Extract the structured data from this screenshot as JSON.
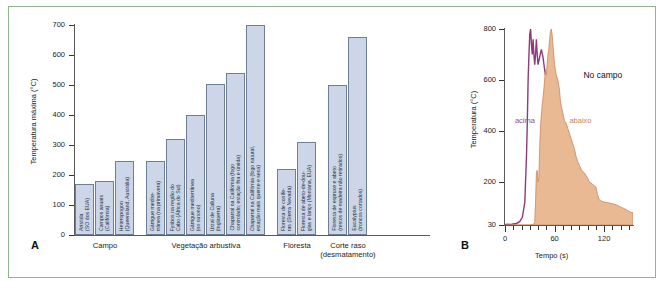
{
  "figure": {
    "panelA_letter": "A",
    "panelB_letter": "B"
  },
  "chart_data": [
    {
      "type": "bar",
      "panel": "A",
      "title": "",
      "xlabel": "",
      "ylabel": "Temperatura máxima (°C)",
      "ylim": [
        0,
        700
      ],
      "yticks": [
        0,
        100,
        200,
        300,
        400,
        500,
        600,
        700
      ],
      "grid": false,
      "bar_color": "#ccd6e8",
      "bar_border_color": "#6d7e96",
      "groups": [
        {
          "label": "Campo",
          "bars": [
            {
              "label": "Aristida\n(SO dos EUA)",
              "value": 170
            },
            {
              "label": "Campos anuais\n(Califórnia)",
              "value": 180
            },
            {
              "label": "Heteropogon\n(Queensland, Austrália)",
              "value": 248
            }
          ]
        },
        {
          "label": "Vegetação arbustiva",
          "bars": [
            {
              "label": "Gárrigue medite-\nrrânea (na primavera)",
              "value": 248
            },
            {
              "label": "Fynbos na região do\nCabo (África do Sul)",
              "value": 320
            },
            {
              "label": "Gárrigue mediterrânea\n(no outono)",
              "value": 400
            },
            {
              "label": "Urzal de Calluna\n(Inglaterra)",
              "value": 502
            },
            {
              "label": "Chaparral na Califórnia (fogo\ncontrolado; estação fria e úmida)",
              "value": 540
            },
            {
              "label": "Chaparral na Califórnia (fogo natural,\nestação mais quente e seca)",
              "value": 700
            }
          ]
        },
        {
          "label": "Floresta",
          "bars": [
            {
              "label": "Floresta de conífe-\nras (Sierra Nevada)",
              "value": 220
            },
            {
              "label": "Floresta de abeto-de-dou-\nglas e lariço (Montana, EUA)",
              "value": 310
            }
          ]
        },
        {
          "label": "Corte raso\n(desmatamento)",
          "bars": [
            {
              "label": "Floresta de espruce e abeto\n(restos de madeira não retirados)",
              "value": 500
            },
            {
              "label": "Eucalyptus\n(troncos cortados)",
              "value": 660
            }
          ]
        }
      ]
    },
    {
      "type": "area",
      "panel": "B",
      "title": "No campo",
      "xlabel": "Tempo (s)",
      "ylabel": "Temperatura (°C)",
      "xlim": [
        0,
        155
      ],
      "ylim": [
        30,
        800
      ],
      "xticks": [
        0,
        60,
        120
      ],
      "yticks": [
        30,
        200,
        400,
        600,
        800
      ],
      "grid": false,
      "series": [
        {
          "name": "acima",
          "color": "#8e3a78",
          "style": "line",
          "points": [
            [
              0,
              32
            ],
            [
              8,
              33
            ],
            [
              14,
              36
            ],
            [
              18,
              44
            ],
            [
              21,
              60
            ],
            [
              24,
              120
            ],
            [
              26,
              300
            ],
            [
              27,
              430
            ],
            [
              28,
              600
            ],
            [
              29,
              700
            ],
            [
              30,
              780
            ],
            [
              31,
              800
            ],
            [
              32,
              740
            ],
            [
              33,
              700
            ],
            [
              34,
              760
            ],
            [
              35,
              700
            ],
            [
              36,
              660
            ],
            [
              37,
              700
            ],
            [
              38,
              760
            ],
            [
              39,
              700
            ],
            [
              40,
              660
            ],
            [
              42,
              690
            ],
            [
              44,
              720
            ],
            [
              46,
              690
            ],
            [
              48,
              640
            ],
            [
              50,
              600
            ],
            [
              52,
              560
            ],
            [
              54,
              520
            ],
            [
              56,
              470
            ],
            [
              58,
              500
            ],
            [
              60,
              450
            ],
            [
              62,
              400
            ],
            [
              64,
              350
            ],
            [
              66,
              300
            ],
            [
              68,
              260
            ],
            [
              70,
              230
            ],
            [
              72,
              200
            ],
            [
              74,
              185
            ],
            [
              76,
              170
            ],
            [
              78,
              165
            ],
            [
              80,
              175
            ],
            [
              82,
              160
            ],
            [
              84,
              150
            ],
            [
              86,
              140
            ],
            [
              88,
              130
            ],
            [
              90,
              125
            ],
            [
              94,
              118
            ],
            [
              98,
              110
            ],
            [
              102,
              105
            ],
            [
              106,
              95
            ],
            [
              110,
              82
            ],
            [
              114,
              70
            ],
            [
              118,
              62
            ],
            [
              122,
              58
            ],
            [
              126,
              56
            ],
            [
              130,
              50
            ],
            [
              134,
              44
            ],
            [
              138,
              48
            ],
            [
              142,
              46
            ],
            [
              146,
              44
            ],
            [
              150,
              42
            ],
            [
              154,
              42
            ]
          ]
        },
        {
          "name": "abaixo",
          "color": "#c8855f",
          "fill": "#e9b994",
          "style": "area",
          "points": [
            [
              0,
              30
            ],
            [
              30,
              30
            ],
            [
              34,
              32
            ],
            [
              36,
              40
            ],
            [
              37,
              120
            ],
            [
              38,
              235
            ],
            [
              39,
              245
            ],
            [
              40,
              200
            ],
            [
              41,
              215
            ],
            [
              42,
              330
            ],
            [
              43,
              420
            ],
            [
              44,
              460
            ],
            [
              45,
              500
            ],
            [
              46,
              530
            ],
            [
              47,
              560
            ],
            [
              48,
              600
            ],
            [
              49,
              640
            ],
            [
              50,
              620
            ],
            [
              51,
              660
            ],
            [
              52,
              700
            ],
            [
              53,
              720
            ],
            [
              54,
              760
            ],
            [
              55,
              790
            ],
            [
              56,
              800
            ],
            [
              57,
              780
            ],
            [
              58,
              740
            ],
            [
              59,
              700
            ],
            [
              60,
              660
            ],
            [
              61,
              640
            ],
            [
              62,
              620
            ],
            [
              63,
              610
            ],
            [
              64,
              600
            ],
            [
              65,
              580
            ],
            [
              66,
              560
            ],
            [
              67,
              520
            ],
            [
              68,
              500
            ],
            [
              70,
              470
            ],
            [
              72,
              440
            ],
            [
              74,
              430
            ],
            [
              76,
              410
            ],
            [
              78,
              390
            ],
            [
              80,
              370
            ],
            [
              82,
              350
            ],
            [
              84,
              330
            ],
            [
              86,
              300
            ],
            [
              88,
              280
            ],
            [
              90,
              265
            ],
            [
              92,
              250
            ],
            [
              94,
              240
            ],
            [
              96,
              235
            ],
            [
              98,
              225
            ],
            [
              100,
              215
            ],
            [
              102,
              200
            ],
            [
              104,
              195
            ],
            [
              106,
              190
            ],
            [
              108,
              185
            ],
            [
              110,
              180
            ],
            [
              112,
              150
            ],
            [
              114,
              130
            ],
            [
              116,
              125
            ],
            [
              118,
              122
            ],
            [
              120,
              120
            ],
            [
              124,
              118
            ],
            [
              128,
              115
            ],
            [
              132,
              112
            ],
            [
              136,
              108
            ],
            [
              140,
              100
            ],
            [
              144,
              95
            ],
            [
              148,
              88
            ],
            [
              152,
              80
            ],
            [
              155,
              78
            ],
            [
              155,
              30
            ]
          ]
        }
      ],
      "annotations": [
        {
          "text": "No campo",
          "x": 95,
          "y": 620,
          "color": "#111111"
        },
        {
          "text": "acima",
          "x": 12,
          "y": 440,
          "color": "#9a4a86"
        },
        {
          "text": "abaixo",
          "x": 78,
          "y": 440,
          "color": "#c8855f"
        }
      ]
    }
  ]
}
